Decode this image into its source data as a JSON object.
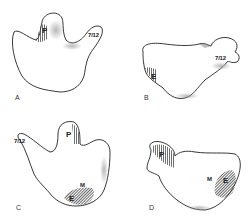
{
  "figure": {
    "panels": [
      {
        "id": "A",
        "label": "A",
        "regions": [
          "P",
          "7/12"
        ]
      },
      {
        "id": "B",
        "label": "B",
        "regions": [
          "E",
          "7/12"
        ]
      },
      {
        "id": "C",
        "label": "C",
        "regions": [
          "P",
          "M",
          "E",
          "7/12"
        ]
      },
      {
        "id": "D",
        "label": "D",
        "regions": [
          "P",
          "M",
          "E"
        ]
      }
    ]
  },
  "colors": {
    "outline": "#222222",
    "fill": "#ffffff",
    "hatch": "#555555",
    "shade": "#bbbbbb"
  }
}
